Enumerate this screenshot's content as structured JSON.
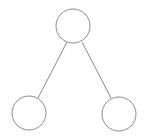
{
  "diagram": {
    "type": "tree",
    "stroke_color": "#8a8a8a",
    "fill_color": "#ffffff",
    "background": "#ffffff",
    "nodes": [
      {
        "id": "root",
        "label": "",
        "cx": 73,
        "cy": 26,
        "r": 17
      },
      {
        "id": "left-child",
        "label": "",
        "cx": 29,
        "cy": 113,
        "r": 17
      },
      {
        "id": "right-child",
        "label": "",
        "cx": 119,
        "cy": 114,
        "r": 17
      }
    ],
    "edges": [
      {
        "from": "root",
        "to": "left-child",
        "x1": 67,
        "y1": 42,
        "x2": 38,
        "y2": 98
      },
      {
        "from": "root",
        "to": "right-child",
        "x1": 82,
        "y1": 42,
        "x2": 111,
        "y2": 98
      }
    ]
  }
}
